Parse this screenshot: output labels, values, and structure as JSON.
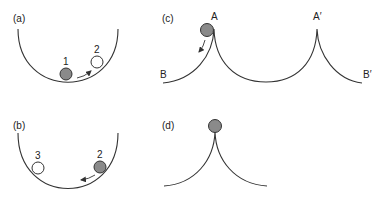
{
  "colors": {
    "line": "#333333",
    "ball_filled": "#8a8a8a",
    "ball_empty": "#ffffff",
    "background": "#ffffff"
  },
  "panels": {
    "a": {
      "label": "(a)",
      "description": "Ball rolling in a bowl from position 1 to position 2",
      "balls": [
        {
          "id": "1",
          "label": "1",
          "state": "filled"
        },
        {
          "id": "2",
          "label": "2",
          "state": "empty"
        }
      ],
      "arrow_direction": "right-up"
    },
    "b": {
      "label": "(b)",
      "description": "Ball rolling in a bowl from position 2 toward position 3",
      "balls": [
        {
          "id": "3",
          "label": "3",
          "state": "empty"
        },
        {
          "id": "2",
          "label": "2",
          "state": "filled"
        }
      ],
      "arrow_direction": "left-down"
    },
    "c": {
      "label": "(c)",
      "description": "Ball on a cusp at A rolling toward B; periodic cusps A and A′",
      "points": {
        "A": "A",
        "A_prime": "A′",
        "B": "B",
        "B_prime": "B′"
      },
      "ball_state": "filled",
      "arrow_direction": "left-down"
    },
    "d": {
      "label": "(d)",
      "description": "Ball balanced on top of a single cusp",
      "ball_state": "filled"
    }
  }
}
